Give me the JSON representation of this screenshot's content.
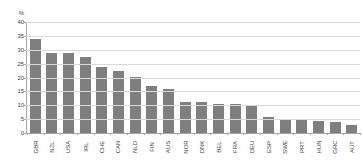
{
  "chart_data": {
    "type": "bar",
    "title": "",
    "xlabel": "",
    "ylabel": "%",
    "ylim": [
      0,
      40
    ],
    "yticks": [
      0,
      5,
      10,
      15,
      20,
      25,
      30,
      35,
      40
    ],
    "grid": true,
    "legend": false,
    "bar_color": "#7f7f7f",
    "gridline_color": "#d9d9d9",
    "axis_color": "#a6a6a6",
    "categories": [
      "GBR",
      "NZL",
      "USA",
      "IRL",
      "CHE",
      "CAN",
      "NLD",
      "FIN",
      "AUS",
      "NOR",
      "DNK",
      "BEL",
      "FRA",
      "DEU",
      "ESP",
      "SWE",
      "PRT",
      "HUN",
      "GRC",
      "AUT"
    ],
    "values": [
      33.8,
      28.9,
      28.8,
      27.4,
      23.8,
      22.3,
      20.1,
      16.8,
      15.9,
      11.3,
      11.0,
      10.6,
      10.3,
      10.2,
      5.9,
      4.8,
      4.8,
      4.4,
      4.0,
      3.0
    ]
  }
}
